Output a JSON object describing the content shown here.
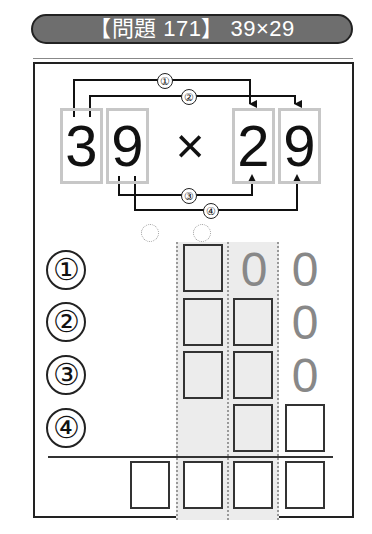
{
  "header": {
    "title": "【問題 171】 39×29"
  },
  "problem": {
    "multiplicand_digits": [
      "3",
      "9"
    ],
    "operator": "×",
    "multiplier_digits": [
      "2",
      "9"
    ],
    "step_labels": [
      "①",
      "②",
      "③",
      "④"
    ]
  },
  "grid": {
    "row_labels": [
      "①",
      "②",
      "③",
      "④"
    ],
    "zeros": {
      "row1": [
        "0",
        "0"
      ],
      "row2": [
        "0"
      ],
      "row3": [
        "0"
      ]
    }
  },
  "colors": {
    "header_bg": "#6e6e6e",
    "digit_box_border": "#c7c7c7",
    "column_shade": "#ececec",
    "zero_gray": "#888888"
  }
}
